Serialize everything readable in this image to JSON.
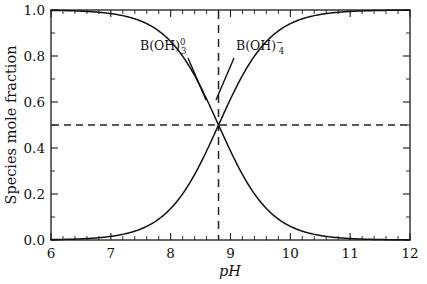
{
  "chart_data": {
    "type": "line",
    "title": "",
    "xlabel": "pH",
    "ylabel": "Species mole fraction",
    "xlim": [
      6,
      12
    ],
    "ylim": [
      0.0,
      1.0
    ],
    "grid": false,
    "legend_position": "inline-annotations",
    "x_major_ticks": [
      6,
      7,
      8,
      9,
      10,
      11,
      12
    ],
    "x_major_tick_labels": [
      "6",
      "7",
      "8",
      "9",
      "10",
      "11",
      "12"
    ],
    "x_minor_tick_step": 0.2,
    "y_major_ticks": [
      0.0,
      0.2,
      0.4,
      0.6,
      0.8,
      1.0
    ],
    "y_major_tick_labels": [
      "0.0",
      "0.2",
      "0.4",
      "0.6",
      "0.8",
      "1.0"
    ],
    "y_minor_tick_step": 0.1,
    "pKa": 8.8,
    "annotations": [
      {
        "name": "horizontal-half-line",
        "kind": "dashed-horizontal",
        "y": 0.5,
        "label": "0.5"
      },
      {
        "name": "vertical-pka-line",
        "kind": "dashed-vertical",
        "x": 8.8,
        "label": "8.8"
      }
    ],
    "series": [
      {
        "name": "B(OH)3-0",
        "label_base": "B(OH)",
        "label_sub": "3",
        "label_sup": "0",
        "color": "#111111",
        "x": [
          6.0,
          6.2,
          6.4,
          6.6,
          6.8,
          7.0,
          7.2,
          7.4,
          7.6,
          7.8,
          8.0,
          8.2,
          8.4,
          8.6,
          8.8,
          9.0,
          9.2,
          9.4,
          9.6,
          9.8,
          10.0,
          10.2,
          10.4,
          10.6,
          10.8,
          11.0,
          11.2,
          11.4,
          11.6,
          11.8,
          12.0
        ],
        "values": [
          0.998,
          0.998,
          0.996,
          0.994,
          0.99,
          0.984,
          0.975,
          0.961,
          0.94,
          0.909,
          0.863,
          0.8,
          0.715,
          0.613,
          0.5,
          0.387,
          0.285,
          0.2,
          0.137,
          0.091,
          0.059,
          0.038,
          0.025,
          0.016,
          0.01,
          0.006,
          0.004,
          0.0025,
          0.0016,
          0.001,
          0.0006
        ]
      },
      {
        "name": "B(OH)4-minus",
        "label_base": "B(OH)",
        "label_sub": "4",
        "label_sup": "−",
        "color": "#111111",
        "x": [
          6.0,
          6.2,
          6.4,
          6.6,
          6.8,
          7.0,
          7.2,
          7.4,
          7.6,
          7.8,
          8.0,
          8.2,
          8.4,
          8.6,
          8.8,
          9.0,
          9.2,
          9.4,
          9.6,
          9.8,
          10.0,
          10.2,
          10.4,
          10.6,
          10.8,
          11.0,
          11.2,
          11.4,
          11.6,
          11.8,
          12.0
        ],
        "values": [
          0.002,
          0.002,
          0.004,
          0.006,
          0.01,
          0.016,
          0.025,
          0.039,
          0.06,
          0.091,
          0.137,
          0.2,
          0.285,
          0.387,
          0.5,
          0.613,
          0.715,
          0.8,
          0.863,
          0.909,
          0.941,
          0.962,
          0.975,
          0.984,
          0.99,
          0.994,
          0.996,
          0.9975,
          0.9984,
          0.999,
          0.9994
        ]
      }
    ]
  }
}
